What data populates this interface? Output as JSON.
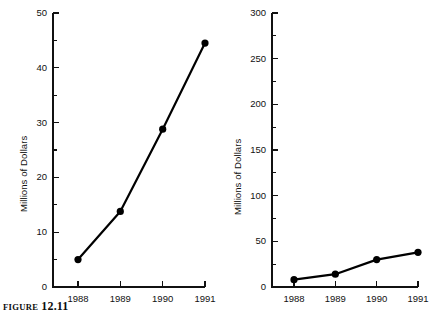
{
  "figure": {
    "caption_label": "Figure",
    "caption_number": "12.11"
  },
  "chart_data": [
    {
      "id": "left",
      "type": "line",
      "title": "",
      "xlabel": "",
      "ylabel": "Millions of Dollars",
      "categories": [
        "1988",
        "1989",
        "1990",
        "1991"
      ],
      "values": [
        5,
        13.8,
        28.8,
        44.5
      ],
      "series": [
        {
          "name": "Sales",
          "values": [
            5,
            13.8,
            28.8,
            44.5
          ]
        }
      ],
      "ylim": [
        0,
        50
      ],
      "ytick_labels": [
        "0",
        "10",
        "20",
        "30",
        "40",
        "50"
      ],
      "ytick_values": [
        0,
        10,
        20,
        30,
        40,
        50
      ],
      "yminor_values": [
        5,
        15,
        25,
        35,
        45
      ],
      "xtick_labels": [
        "1988",
        "1989",
        "1990",
        "1991"
      ],
      "grid": "off",
      "legend": "none",
      "marker": "filled-circle",
      "line_color": "#000000"
    },
    {
      "id": "right",
      "type": "line",
      "title": "",
      "xlabel": "",
      "ylabel": "Millions of Dollars",
      "categories": [
        "1988",
        "1989",
        "1990",
        "1991"
      ],
      "values": [
        8,
        14,
        30,
        38
      ],
      "series": [
        {
          "name": "Sales",
          "values": [
            8,
            14,
            30,
            38
          ]
        }
      ],
      "ylim": [
        0,
        300
      ],
      "ytick_labels": [
        "0",
        "50",
        "100",
        "150",
        "200",
        "250",
        "300"
      ],
      "ytick_values": [
        0,
        50,
        100,
        150,
        200,
        250,
        300
      ],
      "yminor_values": [
        25,
        75,
        125,
        175,
        225,
        275
      ],
      "xtick_labels": [
        "1988",
        "1989",
        "1990",
        "1991"
      ],
      "grid": "off",
      "legend": "none",
      "marker": "filled-circle",
      "line_color": "#000000"
    }
  ]
}
